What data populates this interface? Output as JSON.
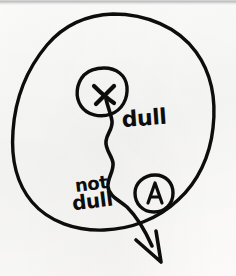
{
  "diagram": {
    "medium": "black marker on white paper",
    "ink_color": "#0d0d0d",
    "paper_color": "#fbfbfa",
    "scan_edge_color": "#c9c9c9",
    "labels": {
      "dull": "dull",
      "not_dull_line1": "not",
      "not_dull_line2": "dull",
      "x_mark": "x",
      "point_a": "A"
    },
    "shapes": [
      {
        "name": "outer-circle",
        "kind": "circle",
        "center_x": 113,
        "center_y": 126,
        "radius_x": 100,
        "radius_y": 112
      },
      {
        "name": "inner-circle-x",
        "kind": "circle",
        "center_x": 103,
        "center_y": 91,
        "radius_x": 24,
        "radius_y": 24
      },
      {
        "name": "circle-a",
        "kind": "circle",
        "center_x": 154,
        "center_y": 193,
        "radius_x": 19,
        "radius_y": 19
      },
      {
        "name": "wavy-path",
        "kind": "path",
        "description": "squiggly line from x-mark down through circle A exiting outer circle with arrowhead"
      },
      {
        "name": "arrowhead",
        "kind": "arrow",
        "tip_x": 160,
        "tip_y": 262,
        "direction": "down-right"
      }
    ]
  }
}
